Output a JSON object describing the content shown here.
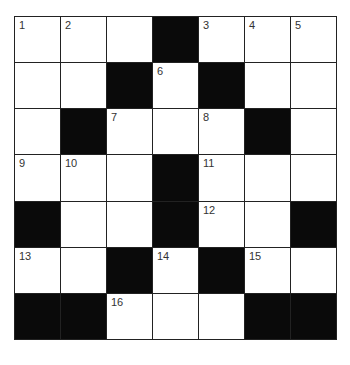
{
  "puzzle": {
    "rows": 7,
    "cols": 7,
    "colors": {
      "black": "#0a0a0a",
      "white": "#ffffff",
      "line": "#222222"
    },
    "grid": [
      [
        {
          "n": "1"
        },
        {
          "n": "2"
        },
        {},
        {
          "b": true
        },
        {
          "n": "3"
        },
        {
          "n": "4"
        },
        {
          "n": "5"
        }
      ],
      [
        {},
        {},
        {
          "b": true
        },
        {
          "n": "6"
        },
        {
          "b": true
        },
        {},
        {}
      ],
      [
        {},
        {
          "b": true
        },
        {
          "n": "7"
        },
        {},
        {
          "n": "8"
        },
        {
          "b": true
        },
        {}
      ],
      [
        {
          "n": "9"
        },
        {
          "n": "10"
        },
        {},
        {
          "b": true
        },
        {
          "n": "11"
        },
        {},
        {}
      ],
      [
        {
          "b": true
        },
        {},
        {},
        {
          "b": true
        },
        {
          "n": "12"
        },
        {},
        {
          "b": true
        }
      ],
      [
        {
          "n": "13"
        },
        {},
        {
          "b": true
        },
        {
          "n": "14"
        },
        {
          "b": true
        },
        {
          "n": "15"
        },
        {}
      ],
      [
        {
          "b": true
        },
        {
          "b": true
        },
        {
          "n": "16"
        },
        {},
        {},
        {
          "b": true
        },
        {
          "b": true
        }
      ]
    ]
  }
}
